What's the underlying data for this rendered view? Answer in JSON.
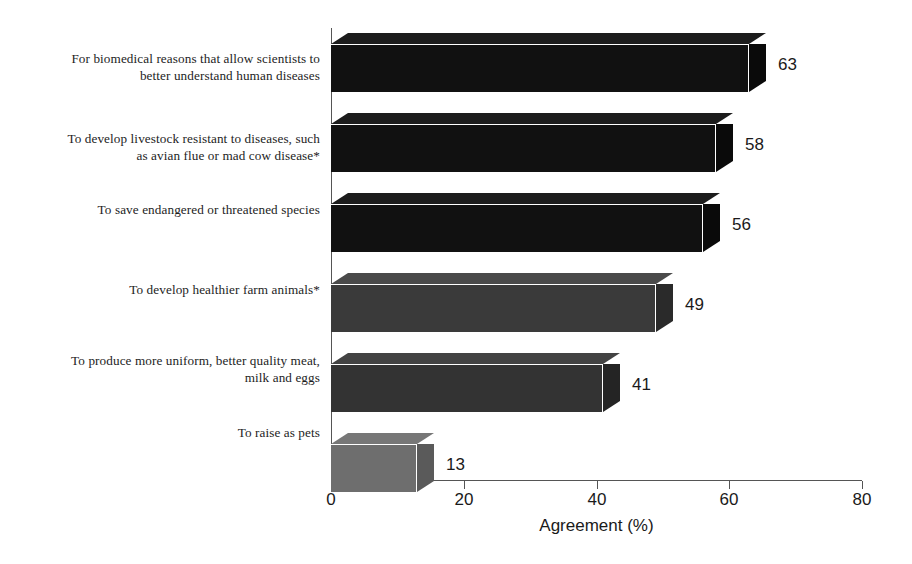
{
  "chart_data": {
    "type": "bar",
    "orientation": "horizontal",
    "title": "",
    "xlabel": "Agreement (%)",
    "ylabel": "",
    "xlim": [
      0,
      80
    ],
    "xticks": [
      0,
      20,
      40,
      60,
      80
    ],
    "grid": false,
    "legend": null,
    "categories": [
      "For biomedical reasons that allow scientists to better understand human diseases",
      "To develop livestock resistant to diseases, such as avian flue or mad cow disease*",
      "To save endangered or threatened species",
      "To develop healthier farm animals*",
      "To produce more uniform, better quality meat, milk and eggs",
      "To raise as pets"
    ],
    "category_lines": [
      [
        "For biomedical reasons that allow scientists to",
        "better understand human diseases"
      ],
      [
        "To develop livestock resistant to diseases, such",
        "as avian flue or mad cow disease*"
      ],
      [
        "To save endangered or threatened species"
      ],
      [
        "To develop healthier farm animals*"
      ],
      [
        "To produce more uniform, better quality meat,",
        "milk and eggs"
      ],
      [
        "To raise as pets"
      ]
    ],
    "values": [
      63,
      58,
      56,
      49,
      41,
      13
    ],
    "value_labels": [
      "63",
      "58",
      "56",
      "49",
      "41",
      "13"
    ],
    "bar_colors": [
      "#111111",
      "#111111",
      "#111111",
      "#3a3a3a",
      "#333333",
      "#6e6e6e"
    ],
    "bar_top_colors": [
      "#1c1c1c",
      "#1c1c1c",
      "#1c1c1c",
      "#4a4a4a",
      "#434343",
      "#777777"
    ],
    "bar_side_colors": [
      "#0a0a0a",
      "#0a0a0a",
      "#0a0a0a",
      "#2a2a2a",
      "#242424",
      "#5a5a5a"
    ]
  },
  "axis": {
    "tick_labels": [
      "0",
      "20",
      "40",
      "60",
      "80"
    ],
    "title": "Agreement (%)"
  }
}
